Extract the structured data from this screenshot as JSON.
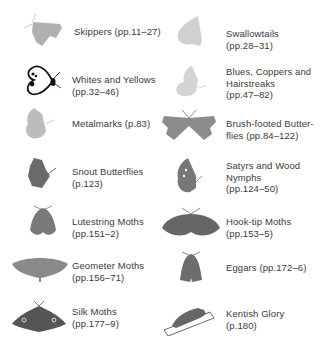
{
  "colors": {
    "light_grey": "#b8b8b8",
    "pale_grey": "#d2d2d2",
    "mid_grey": "#8c8c8c",
    "dark_grey": "#6a6a6a",
    "darker_grey": "#555555",
    "text": "#3a3a3a"
  },
  "families": [
    {
      "name": "Skippers",
      "pages": "(pp.11–27)",
      "label": "Skippers (pp.11–27)",
      "icon": "skipper-icon"
    },
    {
      "name": "Swallowtails",
      "pages": "(pp.28–31)",
      "label": "Swallowtails\n(pp.28–31)",
      "icon": "swallowtail-icon"
    },
    {
      "name": "Whites and Yellows",
      "pages": "(pp.32–46)",
      "label": "Whites and Yellows\n(pp.32–46)",
      "icon": "white-butterfly-icon"
    },
    {
      "name": "Blues, Coppers and Hairstreaks",
      "pages": "(pp.47–82)",
      "label": "Blues, Coppers and\nHairstreaks\n(pp.47–82)",
      "icon": "blue-butterfly-icon"
    },
    {
      "name": "Metalmarks",
      "pages": "(p.83)",
      "label": "Metalmarks (p.83)",
      "icon": "metalmark-icon"
    },
    {
      "name": "Brush-footed Butterflies",
      "pages": "(pp.84–122)",
      "label": "Brush-footed Butter-\nflies (pp.84–122)",
      "icon": "brush-footed-icon"
    },
    {
      "name": "Snout Butterflies",
      "pages": "(p.123)",
      "label": "Snout Butterflies\n(p.123)",
      "icon": "snout-butterfly-icon"
    },
    {
      "name": "Satyrs and Wood Nymphs",
      "pages": "(pp.124–50)",
      "label": "Satyrs and Wood\nNymphs\n(pp.124–50)",
      "icon": "satyr-icon"
    },
    {
      "name": "Lutestring Moths",
      "pages": "(pp.151–2)",
      "label": "Lutestring Moths\n(pp.151–2)",
      "icon": "lutestring-moth-icon"
    },
    {
      "name": "Hook-tip Moths",
      "pages": "(pp.153–5)",
      "label": "Hook-tip Moths\n(pp.153–5)",
      "icon": "hook-tip-moth-icon"
    },
    {
      "name": "Geometer Moths",
      "pages": "(pp.156–71)",
      "label": "Geometer Moths\n(pp.156–71)",
      "icon": "geometer-moth-icon"
    },
    {
      "name": "Eggars",
      "pages": "(pp.172–6)",
      "label": "Eggars (pp.172–6)",
      "icon": "eggar-moth-icon"
    },
    {
      "name": "Silk Moths",
      "pages": "(pp.177–9)",
      "label": "Silk Moths\n(pp.177–9)",
      "icon": "silk-moth-icon"
    },
    {
      "name": "Kentish Glory",
      "pages": "(p.180)",
      "label": "Kentish Glory\n(p.180)",
      "icon": "kentish-glory-icon"
    }
  ]
}
